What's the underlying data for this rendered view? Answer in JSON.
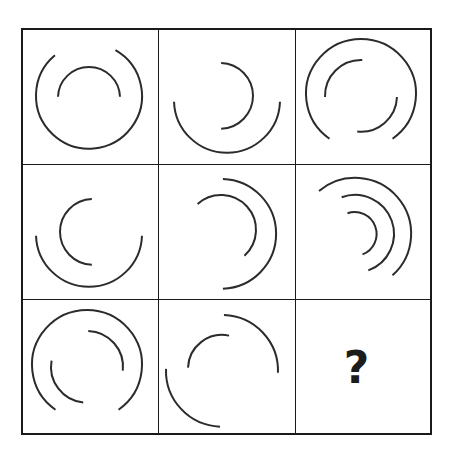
{
  "puzzle": {
    "title": "Arc Matrix Reasoning Puzzle",
    "type": "matrix-reasoning",
    "rows": 3,
    "columns": 3,
    "missing_cell_marker": "?",
    "missing_cell_position": "row3-col3",
    "stroke_color": "#2b2b2b",
    "grid_border_color": "#1a1a1a",
    "background_color": "#ffffff",
    "marker_color": "#1c1c1c",
    "geometry": {
      "grid_left": 21,
      "grid_top": 28,
      "grid_width": 411,
      "grid_height": 407,
      "cell_width": 137,
      "cell_height": 136,
      "border_width": 2,
      "divider_width": 1.6,
      "arc_stroke_width": 2.0
    },
    "cells": [
      {
        "id": "cell-r1c1",
        "row": 1,
        "column": 1,
        "label": "row1-col1",
        "arc_count": 2,
        "arcs": [
          {
            "name": "outer-arc",
            "cx": 68,
            "cy": 68,
            "r": 53,
            "start_deg": 300,
            "end_deg": 590,
            "gap": "right"
          },
          {
            "name": "inner-arc",
            "cx": 68,
            "cy": 70,
            "r": 31,
            "start_deg": 182,
            "end_deg": 358,
            "gap": "bottom"
          }
        ]
      },
      {
        "id": "cell-r1c2",
        "row": 1,
        "column": 2,
        "label": "row1-col2",
        "arc_count": 2,
        "arcs": [
          {
            "name": "outer-arc",
            "cx": 69,
            "cy": 72,
            "r": 53,
            "start_deg": 2,
            "end_deg": 178,
            "gap": "top"
          },
          {
            "name": "inner-arc",
            "cx": 62,
            "cy": 68,
            "r": 33,
            "start_deg": 272,
            "end_deg": 448,
            "gap": "left"
          }
        ]
      },
      {
        "id": "cell-r1c3",
        "row": 1,
        "column": 3,
        "label": "row1-col3",
        "arc_count": 3,
        "arcs": [
          {
            "name": "outer-arc",
            "cx": 66,
            "cy": 66,
            "r": 55,
            "start_deg": 125,
            "end_deg": 415,
            "gap": "lower-left"
          },
          {
            "name": "inner-arc-upper",
            "cx": 66,
            "cy": 68,
            "r": 36,
            "start_deg": 178,
            "end_deg": 272,
            "gap": "segment"
          },
          {
            "name": "inner-arc-lower",
            "cx": 66,
            "cy": 68,
            "r": 36,
            "start_deg": 2,
            "end_deg": 96,
            "gap": "segment"
          }
        ]
      },
      {
        "id": "cell-r2c1",
        "row": 2,
        "column": 1,
        "label": "row2-col1",
        "arc_count": 2,
        "arcs": [
          {
            "name": "outer-arc",
            "cx": 68,
            "cy": 70,
            "r": 53,
            "start_deg": 2,
            "end_deg": 178,
            "gap": "top"
          },
          {
            "name": "inner-arc",
            "cx": 72,
            "cy": 68,
            "r": 33,
            "start_deg": 92,
            "end_deg": 268,
            "gap": "right"
          }
        ]
      },
      {
        "id": "cell-r2c2",
        "row": 2,
        "column": 2,
        "label": "row2-col2",
        "arc_count": 2,
        "arcs": [
          {
            "name": "outer-arc",
            "cx": 63,
            "cy": 70,
            "r": 55,
            "start_deg": 272,
            "end_deg": 448,
            "gap": "left"
          },
          {
            "name": "inner-arc",
            "cx": 63,
            "cy": 66,
            "r": 35,
            "start_deg": 228,
            "end_deg": 408,
            "gap": "lower-left"
          }
        ]
      },
      {
        "id": "cell-r2c3",
        "row": 2,
        "column": 3,
        "label": "row2-col3",
        "arc_count": 3,
        "arcs": [
          {
            "name": "outer-arc",
            "cx": 60,
            "cy": 70,
            "r": 56,
            "start_deg": 230,
            "end_deg": 408,
            "gap": "lower-left-wide"
          },
          {
            "name": "middle-arc",
            "cx": 60,
            "cy": 70,
            "r": 39,
            "start_deg": 250,
            "end_deg": 430,
            "gap": "segment"
          },
          {
            "name": "inner-arc",
            "cx": 60,
            "cy": 70,
            "r": 22,
            "start_deg": 250,
            "end_deg": 430,
            "gap": "segment"
          }
        ]
      },
      {
        "id": "cell-r3c1",
        "row": 3,
        "column": 1,
        "label": "row3-col1",
        "arc_count": 3,
        "arcs": [
          {
            "name": "outer-arc",
            "cx": 66,
            "cy": 66,
            "r": 55,
            "start_deg": 125,
            "end_deg": 415,
            "gap": "lower-left"
          },
          {
            "name": "inner-arc-upper",
            "cx": 66,
            "cy": 68,
            "r": 36,
            "start_deg": 272,
            "end_deg": 366,
            "gap": "segment"
          },
          {
            "name": "inner-arc-lower",
            "cx": 66,
            "cy": 68,
            "r": 36,
            "start_deg": 96,
            "end_deg": 190,
            "gap": "segment"
          }
        ]
      },
      {
        "id": "cell-r3c2",
        "row": 3,
        "column": 2,
        "label": "row3-col2",
        "arc_count": 3,
        "arcs": [
          {
            "name": "outer-arc-top",
            "cx": 64,
            "cy": 72,
            "r": 56,
            "start_deg": 272,
            "end_deg": 362,
            "gap": "segment"
          },
          {
            "name": "outer-arc-bottom",
            "cx": 64,
            "cy": 72,
            "r": 56,
            "start_deg": 92,
            "end_deg": 182,
            "gap": "segment"
          },
          {
            "name": "inner-arc",
            "cx": 64,
            "cy": 70,
            "r": 34,
            "start_deg": 182,
            "end_deg": 282,
            "gap": "segment"
          }
        ]
      },
      {
        "id": "cell-r3c3",
        "row": 3,
        "column": 3,
        "label": "row3-col3",
        "arc_count": 0,
        "is_missing": true,
        "marker": "?",
        "arcs": []
      }
    ]
  }
}
